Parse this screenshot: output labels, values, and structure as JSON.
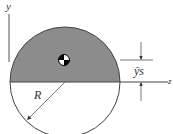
{
  "diagram": {
    "type": "semicircle-centroid",
    "labels": {
      "y_axis": "y",
      "z_axis": "z",
      "radius": "R",
      "centroid_distance": "ȳs"
    },
    "colors": {
      "shaded_region": "#8c8c8c",
      "outline": "#444444",
      "background": "#ffffff"
    },
    "geometry": {
      "center": [
        65,
        82
      ],
      "radius": 55
    }
  }
}
